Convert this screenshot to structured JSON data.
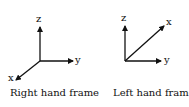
{
  "frames": [
    {
      "caption": "Right hand frame",
      "axes": {
        "z": "z",
        "y": "y",
        "x": "x"
      }
    },
    {
      "caption": "Left hand frame",
      "axes": {
        "z": "z",
        "y": "y",
        "x": "x"
      }
    }
  ]
}
